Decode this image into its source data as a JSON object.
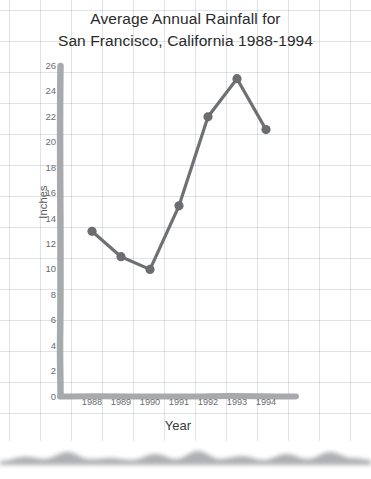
{
  "chart_data": {
    "type": "line",
    "title": "Average Annual Rainfall for",
    "title_line2": "San Francisco, California 1988-1994",
    "xlabel": "Year",
    "ylabel": "Inches",
    "categories": [
      "1988",
      "1989",
      "1990",
      "1991",
      "1992",
      "1993",
      "1994"
    ],
    "values": [
      13,
      11,
      10,
      15,
      22,
      25,
      21
    ],
    "series": [
      {
        "name": "Average Annual Rainfall",
        "values": [
          13,
          11,
          10,
          15,
          22,
          25,
          21
        ]
      }
    ],
    "ylim": [
      0,
      26
    ],
    "ytick_labels": [
      "26",
      "24",
      "22",
      "20",
      "18",
      "16",
      "14",
      "12",
      "10",
      "8",
      "6",
      "4",
      "2",
      "0"
    ],
    "ytick_values": [
      26,
      24,
      22,
      20,
      18,
      16,
      14,
      12,
      10,
      8,
      6,
      4,
      2,
      0
    ],
    "xtick_labels": [
      "1988",
      "1989",
      "1990",
      "1991",
      "1992",
      "1993",
      "1994"
    ],
    "grid": true,
    "legend": "none",
    "line_color": "#6e7073",
    "marker_color": "#6b6d70",
    "axis_color": "#a7a9ac",
    "grid_color": "#96a0af",
    "units": "inches"
  },
  "page": {
    "background": "#ffffff",
    "paper": "graph-paper",
    "bottom_edge": "torn-paper"
  }
}
